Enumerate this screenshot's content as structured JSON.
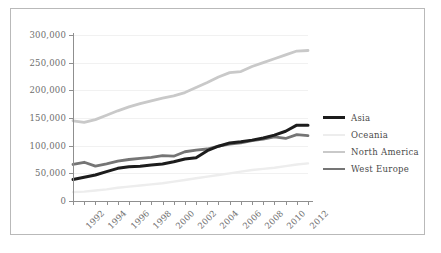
{
  "chart_data": {
    "type": "line",
    "title": "",
    "subtitle": "",
    "xlabel": "",
    "ylabel": "",
    "xlim": [
      1992,
      2013
    ],
    "ylim": [
      0,
      300000
    ],
    "grid": true,
    "legend_position": "right",
    "y_ticks": [
      0,
      50000,
      100000,
      150000,
      200000,
      250000,
      300000
    ],
    "y_tick_labels": [
      "0",
      "50,000",
      "100,000",
      "150,000",
      "200,000",
      "250,000",
      "300,000"
    ],
    "x": [
      1992,
      1993,
      1994,
      1995,
      1996,
      1997,
      1998,
      1999,
      2000,
      2001,
      2002,
      2003,
      2004,
      2005,
      2006,
      2007,
      2008,
      2009,
      2010,
      2011,
      2012,
      2013
    ],
    "x_tick_labels": [
      "1992",
      "1994",
      "1996",
      "1998",
      "2000",
      "2002",
      "2004",
      "2006",
      "2008",
      "2010",
      "2012"
    ],
    "x_tick_label_years": [
      1992,
      1994,
      1996,
      1998,
      2000,
      2002,
      2004,
      2006,
      2008,
      2010,
      2012
    ],
    "series": [
      {
        "name": "Asia",
        "color": "#1c1c1c",
        "width": 3.0,
        "values": [
          39000,
          43000,
          47000,
          53000,
          59000,
          62000,
          63000,
          65000,
          67000,
          71000,
          76000,
          78000,
          91000,
          99000,
          105000,
          107000,
          110000,
          114000,
          119000,
          126000,
          137000,
          137000
        ]
      },
      {
        "name": "Oceania",
        "color": "#ededed",
        "width": 2.4,
        "values": [
          16000,
          17000,
          19000,
          21000,
          24000,
          26000,
          28000,
          30000,
          32000,
          35000,
          38000,
          41000,
          44000,
          47000,
          50000,
          53000,
          56000,
          58000,
          60000,
          63000,
          66000,
          68000
        ]
      },
      {
        "name": "North America",
        "color": "#c9c9c9",
        "width": 2.8,
        "values": [
          145000,
          142000,
          147000,
          155000,
          163000,
          170000,
          176000,
          181000,
          186000,
          190000,
          196000,
          205000,
          214000,
          224000,
          232000,
          234000,
          243000,
          250000,
          257000,
          264000,
          271000,
          272000
        ]
      },
      {
        "name": "West Europe",
        "color": "#757575",
        "width": 2.8,
        "values": [
          66000,
          70000,
          63000,
          67000,
          72000,
          75000,
          77000,
          79000,
          82000,
          81000,
          89000,
          92000,
          94000,
          99000,
          103000,
          105000,
          109000,
          112000,
          116000,
          113000,
          120000,
          118000
        ]
      }
    ]
  }
}
